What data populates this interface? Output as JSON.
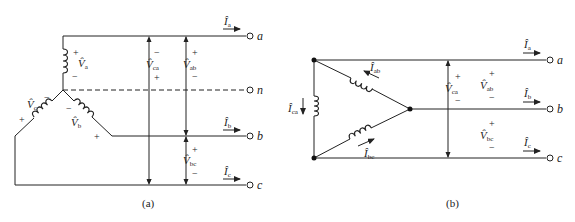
{
  "figure_a": {
    "caption": "(a)",
    "terminals": [
      "a",
      "n",
      "b",
      "c"
    ],
    "phase_voltages": [
      {
        "name": "V̂",
        "sub": "a",
        "plus": "+",
        "minus": "−"
      },
      {
        "name": "V̂",
        "sub": "b",
        "plus": "+",
        "minus": "−"
      },
      {
        "name": "V̂",
        "sub": "c",
        "plus": "+",
        "minus": "−"
      }
    ],
    "line_voltages": [
      {
        "name": "V̂",
        "sub": "ca",
        "plus": "+",
        "minus": "−"
      },
      {
        "name": "V̂",
        "sub": "ab",
        "plus": "+",
        "minus": "−"
      },
      {
        "name": "V̂",
        "sub": "bc",
        "plus": "+",
        "minus": "−"
      }
    ],
    "line_currents": [
      {
        "name": "Î",
        "sub": "a"
      },
      {
        "name": "Î",
        "sub": "b"
      },
      {
        "name": "Î",
        "sub": "c"
      }
    ]
  },
  "figure_b": {
    "caption": "(b)",
    "terminals": [
      "a",
      "b",
      "c"
    ],
    "phase_currents": [
      {
        "name": "Î",
        "sub": "ab"
      },
      {
        "name": "Î",
        "sub": "bc"
      },
      {
        "name": "Î",
        "sub": "ca"
      }
    ],
    "line_voltages": [
      {
        "name": "V̂",
        "sub": "ca",
        "plus": "+",
        "minus": "−"
      },
      {
        "name": "V̂",
        "sub": "ab",
        "plus": "+",
        "minus": "−"
      },
      {
        "name": "V̂",
        "sub": "bc",
        "plus": "+",
        "minus": "−"
      }
    ],
    "line_currents": [
      {
        "name": "Î",
        "sub": "a"
      },
      {
        "name": "Î",
        "sub": "b"
      },
      {
        "name": "Î",
        "sub": "c"
      }
    ]
  }
}
